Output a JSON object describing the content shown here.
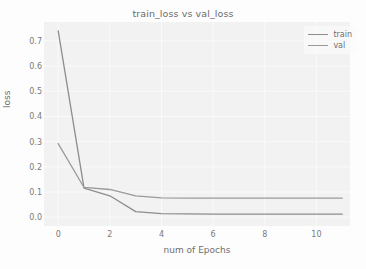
{
  "chart_data": {
    "type": "line",
    "title": "train_loss vs val_loss",
    "xlabel": "num of Epochs",
    "ylabel": "loss",
    "xlim": [
      -0.55,
      11.3
    ],
    "ylim": [
      -0.035,
      0.775
    ],
    "xticks": [
      0,
      2,
      4,
      6,
      8,
      10
    ],
    "xtick_labels": [
      "0",
      "2",
      "4",
      "6",
      "8",
      "10"
    ],
    "yticks": [
      0.0,
      0.1,
      0.2,
      0.3,
      0.4,
      0.5,
      0.6,
      0.7
    ],
    "ytick_labels": [
      "0.0",
      "0.1",
      "0.2",
      "0.3",
      "0.4",
      "0.5",
      "0.6",
      "0.7"
    ],
    "grid": true,
    "legend_position": "upper right",
    "x": [
      0,
      1,
      2,
      3,
      4,
      5,
      6,
      7,
      8,
      9,
      10,
      11
    ],
    "series": [
      {
        "name": "train",
        "color": "#8d8d8d",
        "values": [
          0.74,
          0.115,
          0.085,
          0.022,
          0.014,
          0.013,
          0.012,
          0.012,
          0.012,
          0.012,
          0.012,
          0.012
        ]
      },
      {
        "name": "val",
        "color": "#9a9a9a",
        "values": [
          0.292,
          0.118,
          0.11,
          0.085,
          0.077,
          0.076,
          0.076,
          0.076,
          0.076,
          0.076,
          0.076,
          0.076
        ]
      }
    ]
  },
  "legend": {
    "entries": [
      {
        "label": "train"
      },
      {
        "label": "val"
      }
    ]
  },
  "colors": {
    "train_line": "#8d8d8d",
    "val_line": "#9a9a9a",
    "plot_background": "#f2f2f2",
    "grid": "#fafafa",
    "text": "#6f6f6f"
  }
}
